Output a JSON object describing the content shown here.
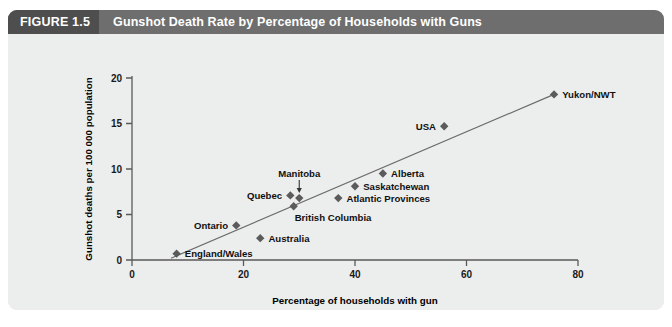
{
  "figure": {
    "number_label": "FIGURE 1.5",
    "title": "Gunshot Death Rate by Percentage of Households with Guns"
  },
  "colors": {
    "header_band": "#6e6e6e",
    "header_number_box": "#4e4e4e",
    "card_background": "#eceded",
    "marker": "#5b5b5b",
    "trend_line": "#6b6b6b",
    "axis": "#5a5a5a",
    "text": "#111111"
  },
  "chart_data": {
    "type": "scatter",
    "title": "Gunshot Death Rate by Percentage of Households with Guns",
    "xlabel": "Percentage of households with gun",
    "ylabel": "Gunshot deaths per 100 000 population",
    "xlim": [
      0,
      80
    ],
    "ylim": [
      0,
      20
    ],
    "xticks": [
      0,
      20,
      40,
      60,
      80
    ],
    "yticks": [
      0,
      5,
      10,
      15,
      20
    ],
    "xtick_labels": [
      "0",
      "20",
      "40",
      "60",
      "80"
    ],
    "ytick_labels": [
      "0",
      "5",
      "10",
      "15",
      "20"
    ],
    "grid": false,
    "legend": "none",
    "points": [
      {
        "label": "England/Wales",
        "x": 8.0,
        "y": 0.7,
        "label_pos": "right"
      },
      {
        "label": "Ontario",
        "x": 18.7,
        "y": 3.8,
        "label_pos": "left"
      },
      {
        "label": "Australia",
        "x": 23.0,
        "y": 2.4,
        "label_pos": "right"
      },
      {
        "label": "British Columbia",
        "x": 29.0,
        "y": 5.9,
        "label_pos": "below-right"
      },
      {
        "label": "Quebec",
        "x": 28.4,
        "y": 7.1,
        "label_pos": "left"
      },
      {
        "label": "Manitoba",
        "x": 30.0,
        "y": 6.8,
        "label_pos": "above-arrow"
      },
      {
        "label": "Atlantic Provinces",
        "x": 37.0,
        "y": 6.8,
        "label_pos": "right"
      },
      {
        "label": "Saskatchewan",
        "x": 40.0,
        "y": 8.1,
        "label_pos": "right"
      },
      {
        "label": "Alberta",
        "x": 45.0,
        "y": 9.5,
        "label_pos": "right"
      },
      {
        "label": "USA",
        "x": 56.0,
        "y": 14.7,
        "label_pos": "left"
      },
      {
        "label": "Yukon/NWT",
        "x": 75.7,
        "y": 18.2,
        "label_pos": "right"
      }
    ],
    "trend_line": {
      "x_start": 7.0,
      "y_start": 0.2,
      "x_end": 75.7,
      "y_end": 18.2
    }
  }
}
